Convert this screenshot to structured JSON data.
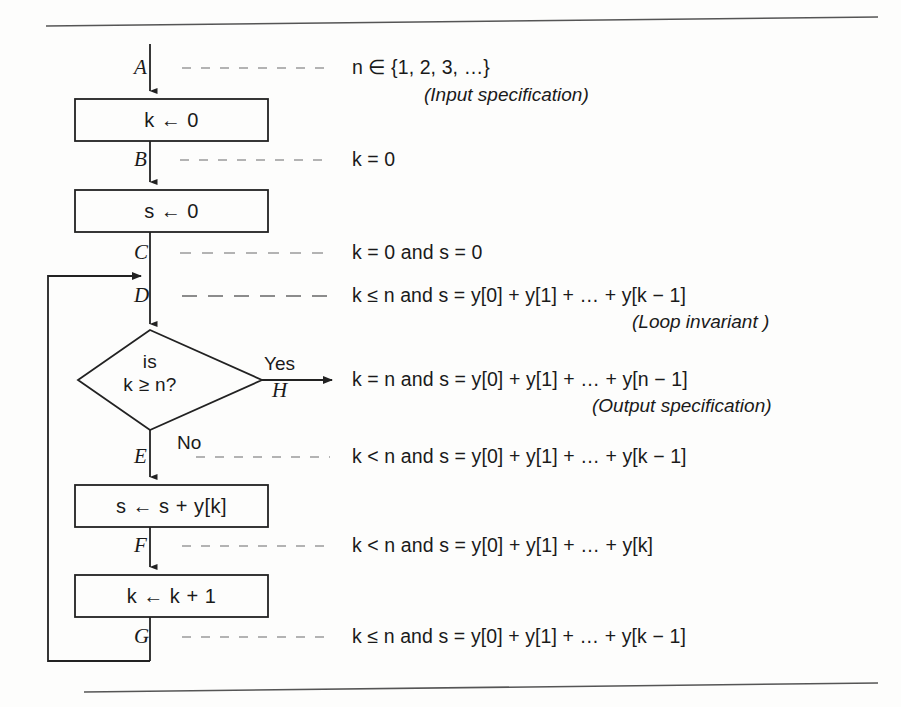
{
  "figure": {
    "type": "flowchart",
    "rules": {
      "top_rule": true,
      "bottom_rule": true
    },
    "process_boxes": [
      {
        "id": "box-k-init",
        "text": "k ← 0"
      },
      {
        "id": "box-s-init",
        "text": "s ← 0"
      },
      {
        "id": "box-s-add",
        "text": "s ← s + y[k]"
      },
      {
        "id": "box-k-incr",
        "text": "k ← k + 1"
      }
    ],
    "decision": {
      "id": "decision-k-ge-n",
      "line1": "is",
      "line2": "k ≥ n?",
      "yes_label": "Yes",
      "no_label": "No"
    },
    "point_labels": [
      "A",
      "B",
      "C",
      "D",
      "H",
      "E",
      "F",
      "G"
    ],
    "assertions": [
      {
        "point": "A",
        "text": "n ∈ {1, 2, 3, …}",
        "note": "(Input specification)",
        "dash_style": "fine"
      },
      {
        "point": "B",
        "text": "k = 0",
        "note": "",
        "dash_style": "fine"
      },
      {
        "point": "C",
        "text": "k = 0 and s = 0",
        "note": "",
        "dash_style": "fine"
      },
      {
        "point": "D",
        "text": "k ≤ n and s = y[0] + y[1] + … + y[k − 1]",
        "note": "(Loop invariant )",
        "dash_style": "bold"
      },
      {
        "point": "H",
        "text": "k = n and s = y[0] + y[1] + … + y[n − 1]",
        "note": "(Output specification)",
        "dash_style": "none"
      },
      {
        "point": "E",
        "text": "k < n and s = y[0] + y[1] + … + y[k − 1]",
        "note": "",
        "dash_style": "fine"
      },
      {
        "point": "F",
        "text": "k < n and s = y[0] + y[1] + … + y[k]",
        "note": "",
        "dash_style": "fine"
      },
      {
        "point": "G",
        "text": "k ≤ n and s = y[0] + y[1] + … + y[k − 1]",
        "note": "",
        "dash_style": "fine"
      }
    ],
    "colors": {
      "ink": "#1a1a1a",
      "stroke": "#222222",
      "dash_light": "#9a9a9a",
      "dash_bold": "#8c8c8c",
      "rule": "#555555",
      "background": "#fdfdfc"
    }
  }
}
